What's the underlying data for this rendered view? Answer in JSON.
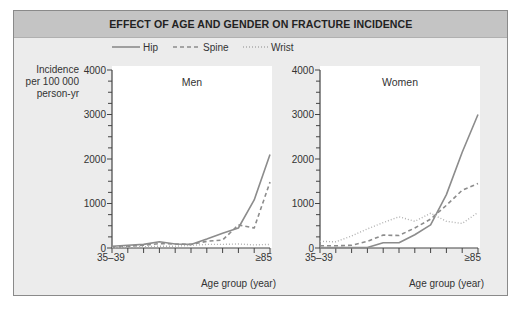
{
  "title": "EFFECT OF AGE AND GENDER ON FRACTURE INCIDENCE",
  "legend": [
    {
      "name": "Hip",
      "style": "solid"
    },
    {
      "name": "Spine",
      "style": "dashed"
    },
    {
      "name": "Wrist",
      "style": "dotted"
    }
  ],
  "y_axis_label": [
    "Incidence",
    "per 100 000",
    "person-yr"
  ],
  "x_axis_label": "Age group (year)",
  "x_tick_first": "35–39",
  "x_tick_last": "≥85",
  "colors": {
    "line": "#8c8c8c",
    "background": "#ececec",
    "plot_bg": "#ffffff",
    "title_band": "#c4c4c4"
  },
  "chart_data": [
    {
      "type": "line",
      "title": "Men",
      "xlabel": "Age group (year)",
      "ylabel": "Incidence per 100 000 person-yr",
      "categories": [
        "35-39",
        "40-44",
        "45-49",
        "50-54",
        "55-59",
        "60-64",
        "65-69",
        "70-74",
        "75-79",
        "80-84",
        "≥85"
      ],
      "ylim": [
        0,
        4000
      ],
      "yticks": [
        0,
        1000,
        2000,
        3000,
        4000
      ],
      "series": [
        {
          "name": "Hip",
          "values": [
            40,
            60,
            80,
            140,
            90,
            80,
            200,
            330,
            450,
            1080,
            2100
          ]
        },
        {
          "name": "Spine",
          "values": [
            20,
            40,
            60,
            100,
            90,
            80,
            150,
            180,
            520,
            450,
            1480
          ]
        },
        {
          "name": "Wrist",
          "values": [
            10,
            20,
            30,
            40,
            40,
            60,
            80,
            80,
            90,
            70,
            80
          ]
        }
      ]
    },
    {
      "type": "line",
      "title": "Women",
      "xlabel": "Age group (year)",
      "ylabel": "Incidence per 100 000 person-yr",
      "categories": [
        "35-39",
        "40-44",
        "45-49",
        "50-54",
        "55-59",
        "60-64",
        "65-69",
        "70-74",
        "75-79",
        "80-84",
        "≥85"
      ],
      "ylim": [
        0,
        4000
      ],
      "yticks": [
        0,
        1000,
        2000,
        3000,
        4000
      ],
      "series": [
        {
          "name": "Hip",
          "values": [
            10,
            10,
            10,
            10,
            120,
            120,
            300,
            520,
            1200,
            2150,
            3000
          ]
        },
        {
          "name": "Spine",
          "values": [
            50,
            50,
            60,
            150,
            290,
            280,
            450,
            650,
            960,
            1300,
            1450
          ]
        },
        {
          "name": "Wrist",
          "values": [
            150,
            140,
            270,
            430,
            570,
            700,
            600,
            780,
            600,
            550,
            800
          ]
        }
      ]
    }
  ]
}
